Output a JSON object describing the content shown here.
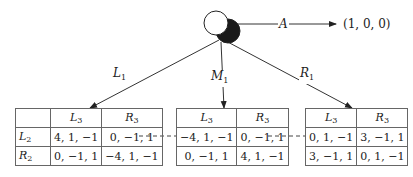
{
  "root": {
    "exit_action": "A",
    "exit_payoff": "(1, 0, 0)",
    "actions": [
      {
        "name": "L",
        "sub": "1"
      },
      {
        "name": "M",
        "sub": "1"
      },
      {
        "name": "R",
        "sub": "1"
      }
    ]
  },
  "tables": [
    {
      "col_headers": [
        {
          "name": "L",
          "sub": "3"
        },
        {
          "name": "R",
          "sub": "3"
        }
      ],
      "row_headers": [
        {
          "name": "L",
          "sub": "2"
        },
        {
          "name": "R",
          "sub": "2"
        }
      ],
      "cells": [
        [
          "4, 1, −1",
          "0, −1, 1"
        ],
        [
          "0, −1, 1",
          "−4, 1, −1"
        ]
      ]
    },
    {
      "col_headers": [
        {
          "name": "L",
          "sub": "3"
        },
        {
          "name": "R",
          "sub": "3"
        }
      ],
      "cells": [
        [
          "−4, 1, −1",
          "0, −1, 1"
        ],
        [
          "0, −1, 1",
          "4, 1, −1"
        ]
      ]
    },
    {
      "col_headers": [
        {
          "name": "L",
          "sub": "3"
        },
        {
          "name": "R",
          "sub": "3"
        }
      ],
      "cells": [
        [
          "0, 1, −1",
          "3, −1, 1"
        ],
        [
          "3, −1, 1",
          "0, 1, −1"
        ]
      ]
    }
  ],
  "colors": {
    "line": "#333333",
    "node_fill_dark": "#1a1a1a",
    "node_fill_light": "#ffffff",
    "grid": "#666666"
  }
}
